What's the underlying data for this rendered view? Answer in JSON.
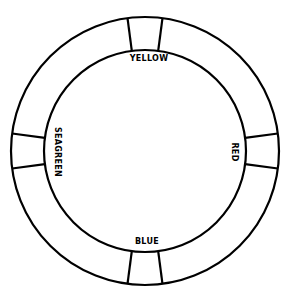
{
  "figure": {
    "background_color": "#ffffff",
    "stroke_color": "#000000",
    "label_color": "#000000"
  },
  "ring": {
    "center_x": 145,
    "center_y": 151,
    "outer_radius": 134,
    "inner_radius": 101,
    "stroke_width": 2.2
  },
  "segments": [
    {
      "id": "yellow",
      "label": "YELLOW",
      "position": "top",
      "angle_deg": 270,
      "half_width_deg": 7.5,
      "label_x": 149,
      "label_y": 59,
      "orientation": "horizontal"
    },
    {
      "id": "red",
      "label": "RED",
      "position": "right",
      "angle_deg": 0,
      "half_width_deg": 7.5,
      "label_x": 234,
      "label_y": 152,
      "orientation": "vertical-cw"
    },
    {
      "id": "blue",
      "label": "BLUE",
      "position": "bottom",
      "angle_deg": 90,
      "half_width_deg": 7.5,
      "label_x": 147,
      "label_y": 242,
      "orientation": "horizontal"
    },
    {
      "id": "seagreen",
      "label": "SEAGREEN",
      "position": "left",
      "angle_deg": 180,
      "half_width_deg": 7.5,
      "label_x": 57,
      "label_y": 152,
      "orientation": "vertical-cw"
    }
  ]
}
